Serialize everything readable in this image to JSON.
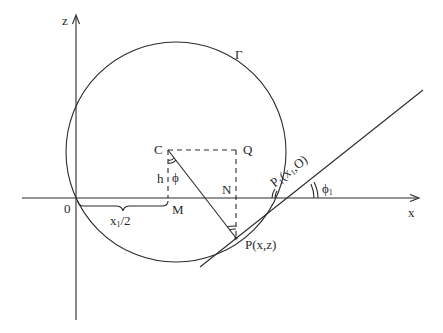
{
  "diagram": {
    "axes": {
      "x_label": "x",
      "z_label": "z",
      "origin_label": "0"
    },
    "curve_label": "Γ",
    "points": {
      "C": "C",
      "Q": "Q",
      "M": "M",
      "N": "N",
      "P": "P(x,z)",
      "P1_main": "P",
      "P1_sub": "1",
      "P1_coords": "(x",
      "P1_coords_sub": "1",
      "P1_coords_end": ",O)"
    },
    "segment_labels": {
      "h": "h",
      "phi": "ϕ",
      "half_x1_pre": "x",
      "half_x1_sub": "1",
      "half_x1_post": "/2",
      "phi1": "ϕ",
      "phi1_sub": "1"
    },
    "colors": {
      "stroke": "#2a2a2a",
      "background": "#ffffff"
    }
  }
}
